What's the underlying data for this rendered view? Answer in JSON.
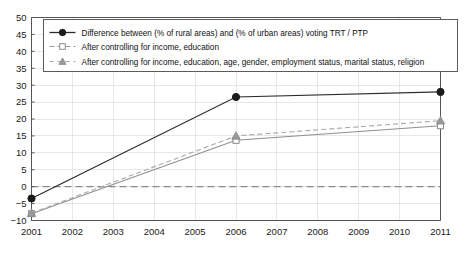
{
  "chart_data": {
    "type": "line",
    "title": "",
    "subtitle": "",
    "xlabel": "",
    "ylabel": "",
    "x": [
      2001,
      2006,
      2011
    ],
    "categories": [
      "2001",
      "2006",
      "2011"
    ],
    "xtick_labels": [
      "2001",
      "2002",
      "2003",
      "2004",
      "2005",
      "2006",
      "2007",
      "2008",
      "2009",
      "2010",
      "2011"
    ],
    "ytick_labels": [
      "50",
      "45",
      "40",
      "35",
      "30",
      "25",
      "20",
      "15",
      "10",
      "5",
      "0",
      "-5",
      "-10"
    ],
    "xlim": [
      2001,
      2011
    ],
    "ylim": [
      -10,
      50
    ],
    "ytick_step": 5,
    "grid": true,
    "legend_position": "top-left-inside",
    "reference_line": {
      "value": 0,
      "style": "dashed",
      "color": "#8a8a8a"
    },
    "series": [
      {
        "name": "Difference between (% of rural areas) and (% of urban areas) voting TRT / PTP",
        "marker": "filled-circle",
        "line_style": "solid",
        "color": "#2b2b2b",
        "values": [
          -3.5,
          26.5,
          28.0
        ]
      },
      {
        "name": "After controlling for income, education",
        "marker": "open-square",
        "line_style": "solid-thin",
        "color": "#8f8f8f",
        "values": [
          -8.0,
          13.7,
          18.0
        ]
      },
      {
        "name": "After controlling for income, education, age, gender, employment status, marital status, religion",
        "marker": "gray-triangle",
        "line_style": "dashed",
        "color": "#a8a8a8",
        "values": [
          -7.8,
          15.0,
          19.5
        ]
      }
    ]
  },
  "legend": {
    "entries": [
      "Difference between (% of rural areas) and (% of urban areas) voting TRT / PTP",
      "After controlling for income, education",
      "After controlling for income, education, age, gender, employment status, marital status, religion"
    ]
  }
}
